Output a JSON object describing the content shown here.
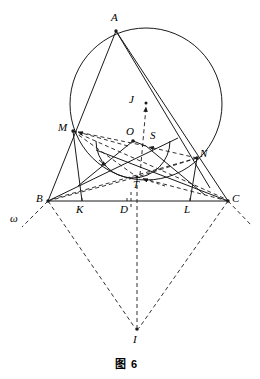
{
  "figure": {
    "caption": "图 6",
    "width": 260,
    "height": 379,
    "stroke_color": "#1a1a1a",
    "background": "#ffffff"
  },
  "points": {
    "A": {
      "label": "A",
      "x": 116,
      "y": 31,
      "label_x": 111,
      "label_y": 14,
      "dot": true
    },
    "M": {
      "label": "M",
      "x": 73,
      "y": 131,
      "label_x": 60,
      "label_y": 123,
      "dot": true
    },
    "N": {
      "label": "N",
      "x": 197,
      "y": 158,
      "label_x": 201,
      "label_y": 150,
      "dot": true
    },
    "B": {
      "label": "B",
      "x": 48,
      "y": 201,
      "label_x": 37,
      "label_y": 194,
      "dot": true
    },
    "C": {
      "label": "C",
      "x": 228,
      "y": 201,
      "label_x": 232,
      "label_y": 194,
      "dot": true
    },
    "K": {
      "label": "K",
      "x": 82,
      "y": 201,
      "label_x": 77,
      "label_y": 205,
      "dot": false
    },
    "D": {
      "label": "D",
      "x": 127,
      "y": 201,
      "label_x": 121,
      "label_y": 205,
      "dot": false
    },
    "L": {
      "label": "L",
      "x": 190,
      "y": 201,
      "label_x": 185,
      "label_y": 205,
      "dot": false
    },
    "O": {
      "label": "O",
      "x": 133,
      "y": 141,
      "label_x": 127,
      "label_y": 127,
      "dot": true
    },
    "S": {
      "label": "S",
      "x": 146,
      "y": 146,
      "label_x": 150,
      "label_y": 131,
      "dot": false
    },
    "T": {
      "label": "T",
      "x": 137,
      "y": 177,
      "label_x": 133,
      "label_y": 180,
      "dot": false
    },
    "J": {
      "label": "J",
      "x": 146,
      "y": 103,
      "label_x": 130,
      "label_y": 96,
      "dot": true
    },
    "I": {
      "label": "I",
      "x": 137,
      "y": 330,
      "label_x": 133,
      "label_y": 335,
      "dot": true
    },
    "omega": {
      "label": "ω",
      "x": 16,
      "y": 219,
      "label_x": 11,
      "label_y": 213,
      "dot": false
    }
  },
  "circles": [
    {
      "name": "circumcircle",
      "cx": 146,
      "cy": 104,
      "r": 76,
      "style": "solid"
    },
    {
      "name": "incircle-arc",
      "cx": 133,
      "cy": 141,
      "r": 37,
      "style": "solid"
    }
  ],
  "solid_segments": [
    {
      "name": "AB",
      "from": "A",
      "to": "B"
    },
    {
      "name": "AC",
      "from": "A",
      "to": "C"
    },
    {
      "name": "BC",
      "from": "B",
      "to": "C"
    },
    {
      "name": "AN-chord",
      "from": "A",
      "to": "N"
    },
    {
      "name": "MB-ext",
      "from": "M",
      "to": "B"
    },
    {
      "name": "MK",
      "from": "M",
      "to": "K"
    },
    {
      "name": "NL",
      "from": "N",
      "to": "L"
    },
    {
      "name": "OM-ray",
      "from": "O",
      "to": "M"
    },
    {
      "name": "ON-ray",
      "from": "O",
      "to": "N"
    },
    {
      "name": "BS",
      "from": "B",
      "to": "S"
    },
    {
      "name": "MC",
      "from": "M",
      "to": "C"
    }
  ],
  "dashed_segments": [
    {
      "name": "J-vertical",
      "from": "J",
      "to": "I"
    },
    {
      "name": "BI",
      "from": "B",
      "to": "I"
    },
    {
      "name": "CI",
      "from": "C",
      "to": "I"
    },
    {
      "name": "MB-dash",
      "from": "M",
      "to": "B"
    },
    {
      "name": "MT",
      "from": "M",
      "to": "T"
    },
    {
      "name": "MC-dash",
      "from": "M",
      "to": "C"
    },
    {
      "name": "NB-dash",
      "from": "N",
      "to": "B"
    },
    {
      "name": "NT",
      "from": "N",
      "to": "T"
    },
    {
      "name": "OT",
      "from": "O",
      "to": "T"
    },
    {
      "name": "BT",
      "from": "B",
      "to": "T"
    },
    {
      "name": "CT",
      "from": "C",
      "to": "T"
    },
    {
      "name": "MS",
      "from": "M",
      "to": "S"
    },
    {
      "name": "SN",
      "from": "S",
      "to": "N"
    },
    {
      "name": "omega-ray-left",
      "from": "B",
      "to": "omega"
    },
    {
      "name": "omega-ray-right",
      "from": "C",
      "to": "C-ext"
    }
  ],
  "arrows": [
    {
      "name": "arrow-to-M",
      "label": "M"
    },
    {
      "name": "arrow-to-S",
      "label": "S"
    },
    {
      "name": "arrow-to-J",
      "label": "J"
    },
    {
      "name": "arrow-to-N",
      "label": "N"
    },
    {
      "name": "arrow-to-T",
      "label": "T"
    }
  ],
  "labels_order": [
    "A",
    "M",
    "N",
    "B",
    "C",
    "K",
    "D",
    "L",
    "O",
    "S",
    "T",
    "J",
    "I",
    "omega"
  ]
}
